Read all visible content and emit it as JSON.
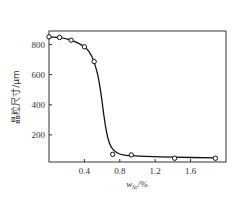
{
  "chart_data": {
    "type": "line",
    "title": "",
    "xlabel": "w_Sc/%",
    "xlabel_main": "w",
    "xlabel_sub": "Sc",
    "xlabel_unit": "/%",
    "ylabel": "晶粒尺寸/μm",
    "xlim": [
      0,
      2.0
    ],
    "ylim": [
      20,
      890
    ],
    "xticks": [
      0.4,
      0.8,
      1.2,
      1.6
    ],
    "xtick_labels": [
      "0.4",
      "0.8",
      "1.2",
      "1.6"
    ],
    "yticks": [
      200,
      400,
      600,
      800
    ],
    "ytick_labels": [
      "200",
      "400",
      "600",
      "800"
    ],
    "grid": false,
    "legend": null,
    "series": [
      {
        "name": "measured",
        "marker": "hollow-circle",
        "line": "none",
        "x": [
          0.0,
          0.12,
          0.25,
          0.4,
          0.51,
          0.72,
          0.93,
          1.42,
          1.88
        ],
        "y": [
          851,
          847,
          829,
          785,
          687,
          71,
          67,
          45,
          45
        ]
      },
      {
        "name": "fitted-curve",
        "marker": "none",
        "line": "solid",
        "x": [
          0.0,
          0.1,
          0.2,
          0.3,
          0.4,
          0.45,
          0.5,
          0.55,
          0.58,
          0.6,
          0.62,
          0.65,
          0.68,
          0.72,
          0.78,
          0.85,
          0.93,
          1.1,
          1.4,
          1.88
        ],
        "y": [
          850,
          848,
          838,
          818,
          785,
          755,
          700,
          600,
          500,
          420,
          330,
          220,
          150,
          105,
          78,
          66,
          62,
          57,
          52,
          48
        ]
      }
    ],
    "colors": {
      "line": "#111111",
      "marker_edge": "#111111",
      "marker_fill": "#ffffff",
      "frame": "#333333"
    }
  }
}
